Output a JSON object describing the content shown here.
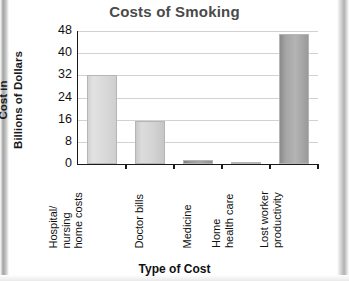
{
  "chart_data": {
    "type": "bar",
    "title": "Costs of Smoking",
    "xlabel": "Type of Cost",
    "ylabel": "Cost in Billions of Dollars",
    "ylabel_lines": [
      "Cost in",
      "Billions of Dollars"
    ],
    "categories": [
      "Hospital/ nursing home costs",
      "Doctor bills",
      "Medicine",
      "Home health care",
      "Lost worker productivity"
    ],
    "category_lines": [
      [
        "Hospital/",
        "nursing",
        "home costs"
      ],
      [
        "Doctor bills"
      ],
      [
        "Medicine"
      ],
      [
        "Home",
        "health care"
      ],
      [
        "Lost worker",
        "productivity"
      ]
    ],
    "values": [
      32,
      15.5,
      1.5,
      0.8,
      47
    ],
    "ylim": [
      0,
      48
    ],
    "yticks": [
      0,
      8,
      16,
      24,
      32,
      40,
      48
    ],
    "ytick_labels": [
      "0",
      "8",
      "16",
      "24",
      "32",
      "40",
      "48"
    ],
    "grid": true,
    "legend": false,
    "bar_colors": [
      "#dadada",
      "#d4d4d4",
      "#9a9a9a",
      "#8e8e8e",
      "#a5a5a5"
    ]
  },
  "colors": {
    "title": "#4a4a4a",
    "axis": "#1a1a1a",
    "grid": "#d2d2d2",
    "background": "#ffffff"
  }
}
